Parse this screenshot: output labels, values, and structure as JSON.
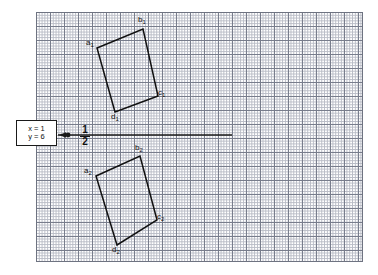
{
  "figure": {
    "background_color": "#ffffff",
    "grid": {
      "minor_color": "#b9bcc6",
      "major_color": "#787d8c",
      "border_color": "#6e7381",
      "minor_cell_px": 2.8,
      "major_every": 5
    },
    "shape_color": "#111111",
    "axis_color": "#1a1a1a"
  },
  "callout": {
    "x_equation": "x = 1",
    "y_equation": "y = 6"
  },
  "fraction_label": {
    "numerator": "1",
    "denominator": "2"
  },
  "shapes": [
    {
      "id": "quad-1",
      "name": "upper-quadrilateral",
      "vertices": [
        {
          "label": "a",
          "sub": "1",
          "x": 97,
          "y": 48,
          "label_x": 86,
          "label_y": 38
        },
        {
          "label": "b",
          "sub": "1",
          "x": 143,
          "y": 29,
          "label_x": 138,
          "label_y": 16
        },
        {
          "label": "c",
          "sub": "1",
          "x": 158,
          "y": 96,
          "label_x": 157,
          "label_y": 89
        },
        {
          "label": "d",
          "sub": "1",
          "x": 115,
          "y": 112,
          "label_x": 112,
          "label_y": 112
        }
      ]
    },
    {
      "id": "quad-2",
      "name": "lower-quadrilateral",
      "vertices": [
        {
          "label": "a",
          "sub": "2",
          "x": 96,
          "y": 176,
          "label_x": 85,
          "label_y": 167
        },
        {
          "label": "b",
          "sub": "2",
          "x": 140,
          "y": 156,
          "label_x": 135,
          "label_y": 144
        },
        {
          "label": "c",
          "sub": "2",
          "x": 157,
          "y": 220,
          "label_x": 156,
          "label_y": 213
        },
        {
          "label": "d",
          "sub": "2",
          "x": 117,
          "y": 245,
          "label_x": 112,
          "label_y": 245
        }
      ]
    }
  ],
  "axis": {
    "y": 135,
    "x_start": 58,
    "x_end": 232,
    "marker_x": 68,
    "arrow_tip_x": 59
  }
}
